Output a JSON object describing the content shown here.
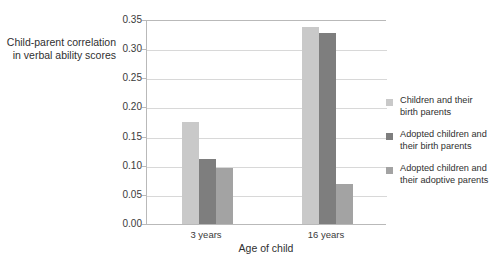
{
  "chart_data": {
    "type": "bar",
    "title": "",
    "xlabel": "Age of child",
    "ylabel": "Child-parent correlation in verbal ability scores",
    "ylabel_lines": [
      "Child-parent correlation",
      "in verbal ability scores"
    ],
    "categories": [
      "3 years",
      "16 years"
    ],
    "ylim": [
      0.0,
      0.35
    ],
    "yticks": [
      "0.00",
      "0.05",
      "0.10",
      "0.15",
      "0.20",
      "0.25",
      "0.30",
      "0.35"
    ],
    "ytick_values": [
      0.0,
      0.05,
      0.1,
      0.15,
      0.2,
      0.25,
      0.3,
      0.35
    ],
    "grid": true,
    "legend_position": "right",
    "series": [
      {
        "name": "Children and their birth parents",
        "name_lines": [
          "Children and their",
          "birth parents"
        ],
        "color": "#c9c9c9",
        "values": [
          0.175,
          0.338
        ]
      },
      {
        "name": "Adopted children and their birth parents",
        "name_lines": [
          "Adopted children and",
          "their birth parents"
        ],
        "color": "#7e7e7e",
        "values": [
          0.112,
          0.328
        ]
      },
      {
        "name": "Adopted children and their adoptive parents",
        "name_lines": [
          "Adopted children and",
          "their adoptive parents"
        ],
        "color": "#a3a3a3",
        "values": [
          0.096,
          0.068
        ]
      }
    ]
  }
}
